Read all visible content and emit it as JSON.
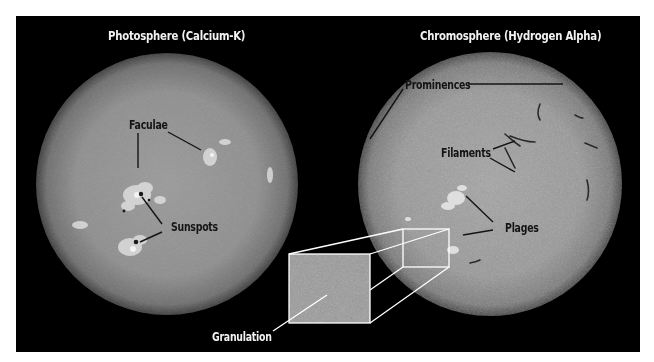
{
  "panels": [
    {
      "title": "Photosphere (Calcium-K)",
      "labels": {
        "faculae": "Faculae",
        "sunspots": "Sunspots"
      }
    },
    {
      "title": "Chromosphere (Hydrogen Alpha)",
      "labels": {
        "prominences": "Prominences",
        "filaments": "Filaments",
        "plages": "Plages"
      }
    }
  ],
  "inset": {
    "label": "Granulation"
  },
  "colors": {
    "background": "#000000",
    "frame": "#ffffff",
    "sun_disk": "#8c8c8c",
    "sun_limb": "#4a4a4a",
    "label_dark": "#141414",
    "label_light": "#f2f2f2",
    "inset_outline": "#ffffff"
  }
}
